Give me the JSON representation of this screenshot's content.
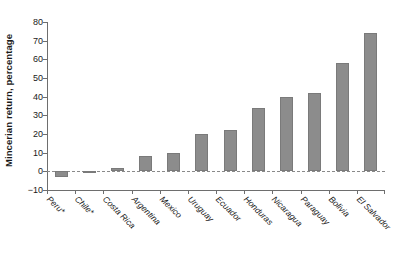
{
  "chart_data": {
    "type": "bar",
    "title": "",
    "xlabel": "",
    "ylabel": "Mincerian return, percentage",
    "ylim": [
      -10,
      80
    ],
    "yticks": [
      80,
      70,
      60,
      50,
      40,
      30,
      20,
      10,
      0,
      -10
    ],
    "ytick_labels": [
      "80",
      "70",
      "60",
      "50",
      "40",
      "30",
      "20",
      "10",
      "0",
      "−10"
    ],
    "grid": false,
    "legend": null,
    "zero_line": true,
    "zero_line_style": "dashed",
    "bar_color": "#8c8c8c",
    "bar_edge_color": "#7a7a7a",
    "axis_color": "#6e6e6e",
    "categories": [
      "Peru*",
      "Chile*",
      "Costa Rica",
      "Argentina",
      "Mexico",
      "Uruguay",
      "Ecuador",
      "Honduras",
      "Nicaragua",
      "Paraguay",
      "Bolivia",
      "El Salvador"
    ],
    "values": [
      -3,
      -1,
      2,
      8,
      10,
      20,
      22,
      34,
      40,
      42,
      58,
      74
    ],
    "footnote_marker": "*"
  }
}
